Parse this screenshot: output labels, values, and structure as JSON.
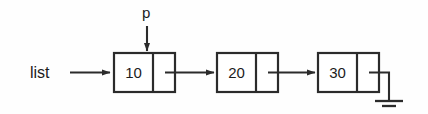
{
  "diagram": {
    "type": "linked-list",
    "background_color": "#fefefe",
    "stroke_color": "#2b2b2b",
    "node_fill_color": "#ffffff",
    "text_color": "#1c1c1c",
    "head_pointer": {
      "label": "list",
      "target_node_index": 0,
      "arrow_direction": "right"
    },
    "node_pointer": {
      "label": "p",
      "target_node_index": 0,
      "arrow_direction": "down"
    },
    "nodes": [
      {
        "index": 0,
        "value": "10",
        "next": 1,
        "link_arrow": "right"
      },
      {
        "index": 1,
        "value": "20",
        "next": 2,
        "link_arrow": "right"
      },
      {
        "index": 2,
        "value": "30",
        "next": null,
        "link_arrow": "ground"
      }
    ],
    "terminator": {
      "symbol": "ground",
      "meaning": "null"
    }
  }
}
